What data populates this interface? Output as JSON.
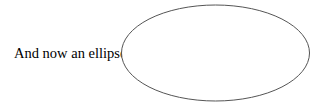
{
  "text": {
    "label": "And now an ellipse:"
  },
  "ellipse": {
    "cx": 215.5,
    "cy": 53,
    "rx": 94,
    "ry": 48,
    "stroke": "#555555",
    "fill": "#ffffff"
  }
}
